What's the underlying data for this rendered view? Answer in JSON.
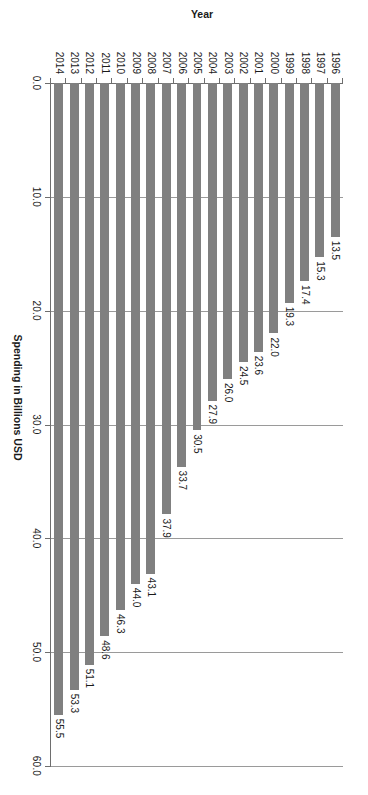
{
  "chart_data": {
    "type": "bar",
    "title": "",
    "subtitle": "",
    "orientation": "vertical",
    "xlabel": "Year",
    "ylabel": "Spending in Billions USD",
    "categories": [
      "1996",
      "1997",
      "1998",
      "1999",
      "2000",
      "2001",
      "2002",
      "2003",
      "2004",
      "2005",
      "2006",
      "2007",
      "2008",
      "2009",
      "2010",
      "2011",
      "2012",
      "2013",
      "2014"
    ],
    "values": [
      13.5,
      15.3,
      17.4,
      19.3,
      22.0,
      23.6,
      24.5,
      26.0,
      27.9,
      30.5,
      33.7,
      37.9,
      43.1,
      44.0,
      46.3,
      48.6,
      51.1,
      53.3,
      55.5
    ],
    "data_labels": [
      "13.5",
      "15.3",
      "17.4",
      "19.3",
      "22.0",
      "23.6",
      "24.5",
      "26.0",
      "27.9",
      "30.5",
      "33.7",
      "37.9",
      "43.1",
      "44.0",
      "46.3",
      "48.6",
      "51.1",
      "53.3",
      "55.5"
    ],
    "ylim": [
      0,
      60
    ],
    "ytick_labels": [
      "0.0",
      "10.0",
      "20.0",
      "30.0",
      "40.0",
      "50.0",
      "60.0"
    ],
    "ytick_values": [
      0,
      10,
      20,
      30,
      40,
      50,
      60
    ],
    "grid": "value-axis-gridlines-only",
    "legend": "none",
    "series": [
      {
        "name": "Spending in Billions USD",
        "color": "#808080",
        "values": [
          13.5,
          15.3,
          17.4,
          19.3,
          22.0,
          23.6,
          24.5,
          26.0,
          27.9,
          30.5,
          33.7,
          37.9,
          43.1,
          44.0,
          46.3,
          48.6,
          51.1,
          53.3,
          55.5
        ]
      }
    ]
  },
  "style": {
    "bar_color": "#808080",
    "grid_color": "#9a9a9a",
    "axis_color": "#6e6e6e",
    "text_color": "#1a1a1a",
    "background": "#ffffff",
    "rotation_degrees": 90
  }
}
